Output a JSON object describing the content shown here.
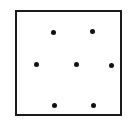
{
  "figure": {
    "kind": "point-configuration-diagram",
    "canvas": {
      "width": 133,
      "height": 126
    },
    "background_color": "#ffffff",
    "frame": {
      "name": "bounding-square",
      "x": 15,
      "y": 10,
      "width": 107,
      "height": 106,
      "stroke_color": "#1a1a1a",
      "stroke_width": 2,
      "fill": "none"
    },
    "marker": {
      "shape": "filled-circle",
      "color": "#111111",
      "diameter": 5
    },
    "rows": [
      {
        "label": "top-row",
        "count": 2
      },
      {
        "label": "middle-row",
        "count": 3
      },
      {
        "label": "bottom-row",
        "count": 2
      }
    ],
    "point_count": 7,
    "points": [
      {
        "id": "p1",
        "name": "dot-top-left",
        "row": "top-row",
        "cx": 53,
        "cy": 32
      },
      {
        "id": "p2",
        "name": "dot-top-right",
        "row": "top-row",
        "cx": 92,
        "cy": 31
      },
      {
        "id": "p3",
        "name": "dot-middle-left",
        "row": "middle-row",
        "cx": 36,
        "cy": 64
      },
      {
        "id": "p4",
        "name": "dot-middle-center",
        "row": "middle-row",
        "cx": 76,
        "cy": 64
      },
      {
        "id": "p5",
        "name": "dot-middle-right",
        "row": "middle-row",
        "cx": 111,
        "cy": 65
      },
      {
        "id": "p6",
        "name": "dot-bottom-left",
        "row": "bottom-row",
        "cx": 54,
        "cy": 105
      },
      {
        "id": "p7",
        "name": "dot-bottom-right",
        "row": "bottom-row",
        "cx": 93,
        "cy": 105
      }
    ]
  }
}
